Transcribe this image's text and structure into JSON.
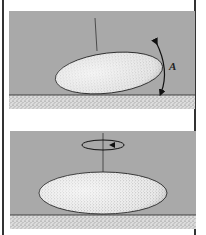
{
  "figure": {
    "panels": [
      {
        "id": "tilt",
        "description": "Disk-shaped body tilted on a surface with rocking arrow",
        "arrow_label": "A"
      },
      {
        "id": "spin",
        "description": "Disk-shaped body lying flat, rotating about vertical axis"
      }
    ]
  },
  "colors": {
    "background": "#a9a9a9",
    "ground": "#d4d4d4",
    "body_fill": "#e8e8e8",
    "line": "#222222",
    "frame": "#333333"
  }
}
